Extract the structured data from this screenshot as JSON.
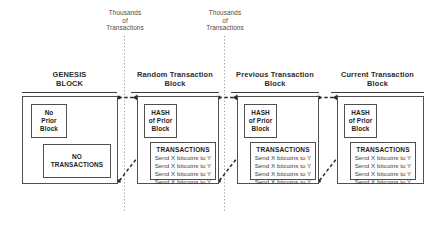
{
  "diagram": {
    "annotations": [
      {
        "id": "annot-left",
        "lines": [
          "Thousands",
          "of",
          "Transactions"
        ]
      },
      {
        "id": "annot-right",
        "lines": [
          "Thousands",
          "of",
          "Transactions"
        ]
      }
    ],
    "blocks": [
      {
        "id": "genesis-block",
        "title_lines": [
          "GENESIS",
          "BLOCK"
        ],
        "header": {
          "lines": [
            "No",
            "Prior",
            "Block"
          ],
          "style": "plain"
        },
        "body": {
          "kind": "empty",
          "lines": [
            "NO",
            "TRANSACTIONS"
          ]
        }
      },
      {
        "id": "random-transaction-block",
        "title_lines": [
          "Random Transaction",
          "Block"
        ],
        "header": {
          "lines": [
            "HASH",
            "of Prior",
            "Block"
          ],
          "style": "curled"
        },
        "body": {
          "kind": "transactions",
          "heading": "TRANSACTIONS",
          "items": [
            "Send X bitcoins to Y",
            "Send X bitcoins to Y",
            "Send X bitcoins to Y",
            "Send X bitcoins to Y"
          ]
        }
      },
      {
        "id": "previous-transaction-block",
        "title_lines": [
          "Previous Transaction",
          "Block"
        ],
        "header": {
          "lines": [
            "HASH",
            "of Prior",
            "Block"
          ],
          "style": "curled"
        },
        "body": {
          "kind": "transactions",
          "heading": "TRANSACTIONS",
          "items": [
            "Send X bitcoins to Y",
            "Send X bitcoins to Y",
            "Send X bitcoins to Y",
            "Send X bitcoins to Y"
          ]
        }
      },
      {
        "id": "current-transaction-block",
        "title_lines": [
          "Current Transaction",
          "Block"
        ],
        "header": {
          "lines": [
            "HASH",
            "of Prior",
            "Block"
          ],
          "style": "curled"
        },
        "body": {
          "kind": "transactions",
          "heading": "TRANSACTIONS",
          "items": [
            "Send X bitcoins to Y",
            "Send X bitcoins to Y",
            "Send X bitcoins to Y",
            "Send X bitcoins to Y"
          ]
        }
      }
    ],
    "colors": {
      "background": "#ffffff",
      "stroke": "#4f4f4f",
      "text": "#222222",
      "muted_text": "#4a4a4a",
      "dotted_guide": "#9a9a9a",
      "connector": "#2b2b2b"
    }
  }
}
